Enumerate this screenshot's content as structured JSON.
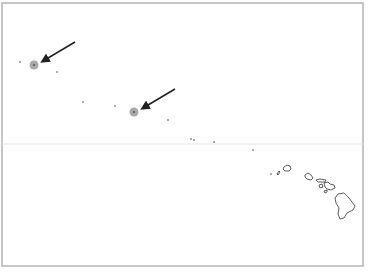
{
  "map": {
    "title": "Northwestern Hawaiian Islands and main Hawaiian Islands",
    "frame": {
      "x": 2,
      "y": 3,
      "width": 361,
      "height": 263,
      "color": "#b4b4b4"
    },
    "reference_line": {
      "y": 144,
      "color": "#e4e4e4",
      "label": ""
    },
    "colors": {
      "background": "#ffffff",
      "island_outline": "#333333",
      "highlight_fill": "#9a9a9a",
      "highlight_center": "#555555",
      "arrow": "#222222",
      "dot": "#444444"
    },
    "highlights": [
      {
        "name": "highlight-site-1",
        "cx": 34,
        "cy": 65,
        "r": 4.5
      },
      {
        "name": "highlight-site-2",
        "cx": 134,
        "cy": 112,
        "r": 4.5
      }
    ],
    "arrows": [
      {
        "name": "arrow-1",
        "x1": 75,
        "y1": 42,
        "x2": 43,
        "y2": 61
      },
      {
        "name": "arrow-2",
        "x1": 175,
        "y1": 89,
        "x2": 143,
        "y2": 108
      }
    ],
    "small_islands": [
      {
        "name": "islet-1",
        "cx": 20,
        "cy": 62
      },
      {
        "name": "islet-2",
        "cx": 57,
        "cy": 72
      },
      {
        "name": "islet-3",
        "cx": 83,
        "cy": 102
      },
      {
        "name": "islet-4",
        "cx": 115,
        "cy": 106
      },
      {
        "name": "islet-5",
        "cx": 168,
        "cy": 120
      },
      {
        "name": "islet-6",
        "cx": 191,
        "cy": 139
      },
      {
        "name": "islet-7",
        "cx": 194,
        "cy": 140
      },
      {
        "name": "islet-8",
        "cx": 214,
        "cy": 142
      },
      {
        "name": "islet-9",
        "cx": 253,
        "cy": 150
      },
      {
        "name": "kaula",
        "cx": 271,
        "cy": 174
      }
    ],
    "main_islands": [
      {
        "name": "niihau",
        "d": "M277,174 L279,171 L280,172 L278,175 Z"
      },
      {
        "name": "kauai",
        "d": "M284,167 L287,165 L290,166 L291,169 L289,171 L285,171 L283,169 Z"
      },
      {
        "name": "oahu",
        "d": "M305,175 L308,173 L311,175 L313,178 L311,180 L307,179 L305,177 Z"
      },
      {
        "name": "molokai",
        "d": "M316,180 L320,179 L326,180 L325,182 L318,182 Z"
      },
      {
        "name": "lanai",
        "d": "M319,185 L322,184 L323,187 L320,188 Z"
      },
      {
        "name": "maui",
        "d": "M324,183 L328,182 L330,184 L334,185 L335,188 L331,190 L327,189 L325,187 Z"
      },
      {
        "name": "kahoolawe",
        "d": "M324,191 L327,190 L327,192 L325,193 Z"
      },
      {
        "name": "hawaii",
        "d": "M338,194 L344,193 L349,198 L355,206 L353,210 L347,213 L344,218 L340,219 L338,214 L339,208 L336,203 L335,198 Z"
      }
    ]
  }
}
